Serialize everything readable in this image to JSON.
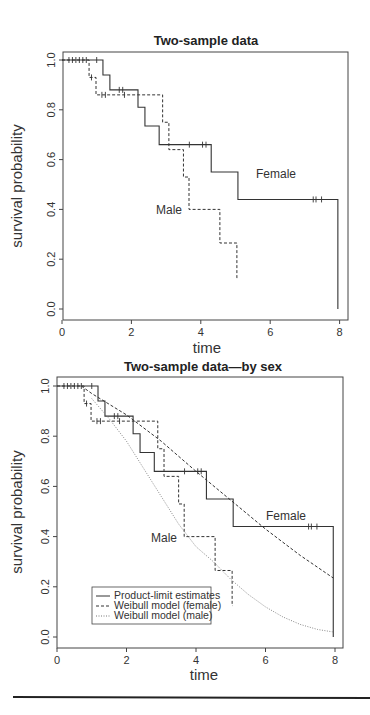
{
  "chart_data": [
    {
      "type": "line",
      "subtype": "step (Kaplan-Meier)",
      "title": "Two-sample data",
      "xlabel": "time",
      "ylabel": "survival probability",
      "xlim": [
        0,
        8.2
      ],
      "ylim": [
        -0.03,
        1.03
      ],
      "xticks": [
        "0",
        "2",
        "4",
        "6",
        "8"
      ],
      "yticks": [
        "0.0",
        "0.2",
        "0.4",
        "0.6",
        "0.8",
        "1.0"
      ],
      "grid": false,
      "annotations": [
        {
          "text": "Female",
          "x": 5.6,
          "y": 0.56
        },
        {
          "text": "Male",
          "x": 2.7,
          "y": 0.4
        }
      ],
      "series": [
        {
          "name": "Female",
          "style": "solid",
          "steps": [
            [
              0,
              1.0
            ],
            [
              1.18,
              0.94
            ],
            [
              1.38,
              0.88
            ],
            [
              2.19,
              0.81
            ],
            [
              2.39,
              0.735
            ],
            [
              2.8,
              0.66
            ],
            [
              4.3,
              0.55
            ],
            [
              5.07,
              0.44
            ],
            [
              7.95,
              0.0
            ]
          ],
          "end_t": 7.95,
          "censored": [
            [
              0.2,
              1.0
            ],
            [
              0.3,
              1.0
            ],
            [
              0.4,
              1.0
            ],
            [
              0.5,
              1.0
            ],
            [
              0.6,
              1.0
            ],
            [
              0.7,
              1.0
            ],
            [
              1.0,
              1.0
            ],
            [
              1.65,
              0.88
            ],
            [
              1.75,
              0.88
            ],
            [
              3.67,
              0.66
            ],
            [
              4.05,
              0.66
            ],
            [
              4.15,
              0.66
            ],
            [
              7.24,
              0.44
            ],
            [
              7.32,
              0.44
            ],
            [
              7.48,
              0.44
            ]
          ]
        },
        {
          "name": "Male",
          "style": "dashed",
          "steps": [
            [
              0,
              1.0
            ],
            [
              0.78,
              0.93
            ],
            [
              0.98,
              0.86
            ],
            [
              2.9,
              0.75
            ],
            [
              3.08,
              0.64
            ],
            [
              3.5,
              0.53
            ],
            [
              3.66,
              0.4
            ],
            [
              4.55,
              0.265
            ],
            [
              5.04,
              0.125
            ]
          ],
          "end_t": 5.04,
          "censored": [
            [
              0.85,
              0.93
            ],
            [
              1.15,
              0.86
            ],
            [
              1.25,
              0.86
            ],
            [
              1.8,
              0.86
            ]
          ]
        }
      ]
    },
    {
      "type": "line",
      "subtype": "step (Kaplan-Meier) with fitted Weibull curves",
      "title": "Two-sample data—by sex",
      "xlabel": "time",
      "ylabel": "survival probability",
      "xlim": [
        0,
        8.2
      ],
      "ylim": [
        -0.03,
        1.03
      ],
      "xticks": [
        "0",
        "2",
        "4",
        "6",
        "8"
      ],
      "yticks": [
        "0.0",
        "0.2",
        "0.4",
        "0.6",
        "0.8",
        "1.0"
      ],
      "grid": false,
      "legend": {
        "position": "bottom-left",
        "entries": [
          {
            "label": "Product-limit estimates",
            "style": "solid"
          },
          {
            "label": "Weibull model (female)",
            "style": "dashed"
          },
          {
            "label": "Weibull model (male)",
            "style": "dotted"
          }
        ]
      },
      "annotations": [
        {
          "text": "Female",
          "x": 5.8,
          "y": 0.53
        },
        {
          "text": "Male",
          "x": 2.7,
          "y": 0.4
        }
      ],
      "series": [
        {
          "name": "Product-limit estimates (female)",
          "style": "solid",
          "steps": [
            [
              0,
              1.0
            ],
            [
              1.18,
              0.94
            ],
            [
              1.38,
              0.88
            ],
            [
              2.19,
              0.81
            ],
            [
              2.39,
              0.735
            ],
            [
              2.8,
              0.66
            ],
            [
              4.3,
              0.55
            ],
            [
              5.07,
              0.44
            ],
            [
              7.95,
              0.0
            ]
          ],
          "end_t": 7.95,
          "censored": [
            [
              0.2,
              1.0
            ],
            [
              0.3,
              1.0
            ],
            [
              0.4,
              1.0
            ],
            [
              0.5,
              1.0
            ],
            [
              0.6,
              1.0
            ],
            [
              0.7,
              1.0
            ],
            [
              1.0,
              1.0
            ],
            [
              1.65,
              0.88
            ],
            [
              1.75,
              0.88
            ],
            [
              3.67,
              0.66
            ],
            [
              4.05,
              0.66
            ],
            [
              4.15,
              0.66
            ],
            [
              7.24,
              0.44
            ],
            [
              7.32,
              0.44
            ],
            [
              7.48,
              0.44
            ]
          ]
        },
        {
          "name": "Product-limit estimates (male)",
          "style": "dashed",
          "steps": [
            [
              0,
              1.0
            ],
            [
              0.78,
              0.93
            ],
            [
              0.98,
              0.86
            ],
            [
              2.9,
              0.75
            ],
            [
              3.08,
              0.64
            ],
            [
              3.5,
              0.53
            ],
            [
              3.66,
              0.4
            ],
            [
              4.55,
              0.265
            ],
            [
              5.04,
              0.125
            ]
          ],
          "end_t": 5.04,
          "censored": [
            [
              0.85,
              0.93
            ],
            [
              1.15,
              0.86
            ],
            [
              1.25,
              0.86
            ],
            [
              1.8,
              0.86
            ]
          ]
        },
        {
          "name": "Weibull model (female)",
          "style": "dashed",
          "x": [
            0.7,
            1.0,
            2.0,
            3.0,
            4.0,
            5.0,
            6.0,
            7.0,
            7.95
          ],
          "values": [
            1.0,
            0.97,
            0.885,
            0.78,
            0.66,
            0.545,
            0.43,
            0.325,
            0.235
          ]
        },
        {
          "name": "Weibull model (male)",
          "style": "dotted",
          "x": [
            1.0,
            1.5,
            2.0,
            2.5,
            3.0,
            3.5,
            4.0,
            4.5,
            5.0,
            5.5,
            6.0,
            6.5,
            7.0,
            7.5,
            7.95
          ],
          "values": [
            0.95,
            0.87,
            0.78,
            0.67,
            0.56,
            0.45,
            0.36,
            0.3,
            0.23,
            0.17,
            0.12,
            0.08,
            0.05,
            0.03,
            0.02
          ]
        }
      ]
    }
  ]
}
